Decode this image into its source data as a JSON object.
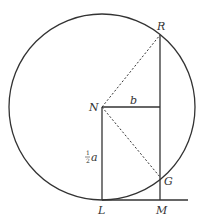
{
  "diagram": {
    "points": {
      "R": {
        "label": "R",
        "x": 160,
        "y": 35
      },
      "N": {
        "label": "N",
        "x": 102,
        "y": 107
      },
      "G": {
        "label": "G",
        "x": 160,
        "y": 177
      },
      "L": {
        "label": "L",
        "x": 102,
        "y": 200
      },
      "M": {
        "label": "M",
        "x": 160,
        "y": 200
      }
    },
    "circle": {
      "cx": 102,
      "cy": 107,
      "r": 93
    },
    "segment_labels": {
      "b": "b",
      "half_a_num": "1",
      "half_a_den": "2",
      "half_a_var": "a"
    },
    "colors": {
      "stroke": "#333333",
      "background": "#ffffff"
    }
  }
}
